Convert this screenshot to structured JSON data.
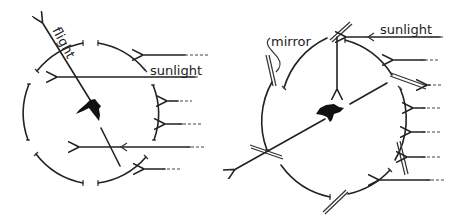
{
  "diagram": {
    "panels": [
      {
        "id": "left",
        "description": "Bird in circular cage with openings; flight direction indicated relative to direct sunlight",
        "labels": {
          "flight": "flight",
          "sunlight": "sunlight"
        }
      },
      {
        "id": "right",
        "description": "Bird in circular cage with mirrors at openings deflecting sunlight by 90 degrees; flight direction shifted",
        "labels": {
          "mirror": "mirror",
          "sunlight": "sunlight"
        }
      }
    ],
    "colors": {
      "ink": "#222222",
      "background": "#ffffff"
    }
  }
}
